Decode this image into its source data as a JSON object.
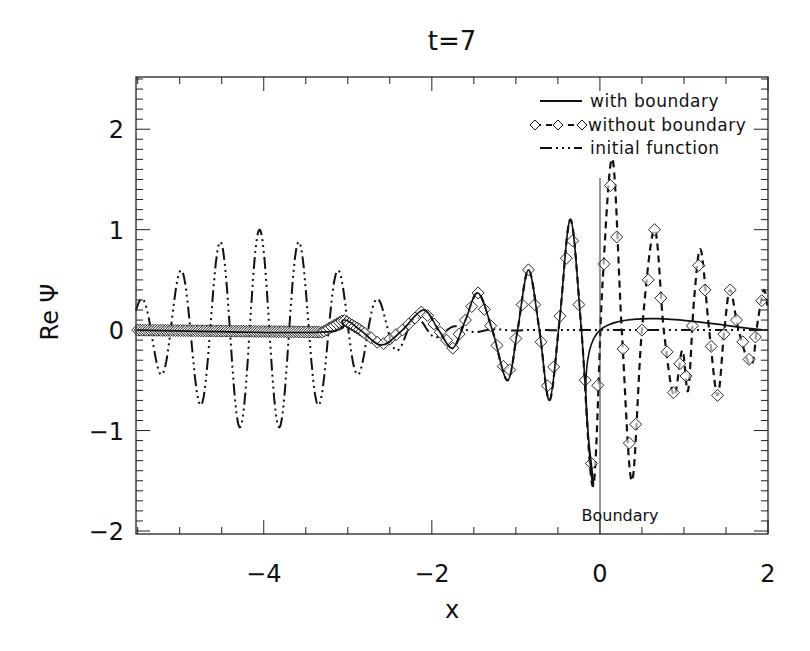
{
  "chart_data": {
    "type": "line",
    "title": "t=7",
    "xlabel": "x",
    "ylabel": "Re Ψ",
    "xlim": [
      -5.52,
      2.0
    ],
    "ylim": [
      -2.03,
      2.52
    ],
    "xticks": [
      -4,
      -2,
      0,
      2
    ],
    "xtick_labels": [
      "−4",
      "−2",
      "0",
      "2"
    ],
    "x_minor_step": 0.5,
    "yticks": [
      -2,
      -1,
      0,
      1,
      2
    ],
    "ytick_labels": [
      "−2",
      "−1",
      "0",
      "1",
      "2"
    ],
    "y_minor_step": 0.1,
    "grid": false,
    "legend_position": "upper right",
    "legend": [
      {
        "label": "with boundary",
        "style": "solid"
      },
      {
        "label": "without boundary",
        "style": "dashed-diamond"
      },
      {
        "label": "initial function",
        "style": "dash-dot-dot"
      }
    ],
    "annotations": [
      {
        "text": "Boundary",
        "x": 0.0,
        "y": -1.85,
        "type": "vertical-line",
        "line_x": 0.0,
        "line_y_top": 1.5
      }
    ],
    "series": [
      {
        "name": "with boundary",
        "style": "solid",
        "x": [
          -5.5,
          -3.3,
          -3.05,
          -2.85,
          -2.6,
          -2.35,
          -2.1,
          -1.92,
          -1.75,
          -1.6,
          -1.45,
          -1.28,
          -1.1,
          -0.98,
          -0.85,
          -0.72,
          -0.6,
          -0.48,
          -0.35,
          -0.22,
          -0.08,
          0.0,
          2.0
        ],
        "y": [
          0.0,
          -0.02,
          0.1,
          0.0,
          -0.15,
          0.0,
          0.2,
          0.0,
          -0.18,
          0.1,
          0.37,
          0.0,
          -0.5,
          0.0,
          0.6,
          0.0,
          -0.7,
          0.1,
          1.1,
          0.0,
          -1.55,
          0.0,
          0.0
        ]
      },
      {
        "name": "without boundary",
        "style": "dashed-diamond",
        "x": [
          -5.5,
          -3.3,
          -3.05,
          -2.85,
          -2.6,
          -2.35,
          -2.1,
          -1.92,
          -1.75,
          -1.6,
          -1.45,
          -1.28,
          -1.1,
          -0.98,
          -0.85,
          -0.72,
          -0.6,
          -0.48,
          -0.35,
          -0.22,
          -0.08,
          0.03,
          0.15,
          0.26,
          0.38,
          0.5,
          0.65,
          0.76,
          0.88,
          0.98,
          1.05,
          1.12,
          1.2,
          1.3,
          1.4,
          1.48,
          1.55,
          1.65,
          1.8,
          1.88,
          1.95,
          2.0
        ],
        "y": [
          0.0,
          -0.02,
          0.1,
          0.0,
          -0.15,
          0.0,
          0.2,
          0.0,
          -0.18,
          0.1,
          0.37,
          0.0,
          -0.5,
          0.0,
          0.6,
          0.0,
          -0.7,
          0.1,
          1.1,
          0.0,
          -1.55,
          0.45,
          1.7,
          0.0,
          -1.5,
          0.0,
          1.0,
          0.0,
          -0.65,
          -0.2,
          -0.6,
          0.3,
          0.8,
          0.0,
          -0.65,
          0.0,
          0.4,
          0.0,
          -0.35,
          0.1,
          0.4,
          0.2
        ]
      },
      {
        "name": "initial function",
        "style": "dash-dot-dot",
        "model": "A*exp(-((x-x0)/w)^2)*cos(2*pi*(x-x0)/lambda)",
        "params": {
          "A": 1.0,
          "x0": -4.05,
          "w": 1.3,
          "lambda": 0.47
        },
        "peaks_x": [
          -5.0,
          -4.5,
          -4.05,
          -3.6,
          -3.05
        ],
        "peaks_y": [
          0.55,
          1.0,
          1.0,
          1.0,
          0.55
        ],
        "troughs_x": [
          -4.78,
          -4.28,
          -3.82,
          -3.32
        ],
        "troughs_y": [
          -1.0,
          -1.0,
          -1.0,
          -1.0
        ]
      }
    ]
  }
}
